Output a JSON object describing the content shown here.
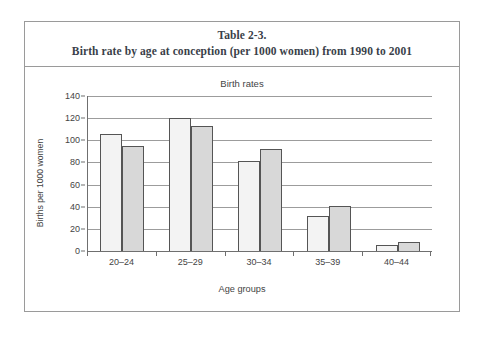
{
  "caption": {
    "line1": "Table 2-3.",
    "line2": "Birth rate by age at conception (per 1000 women) from 1990 to 2001"
  },
  "chart_data": {
    "type": "bar",
    "title": "Birth rates",
    "xlabel": "Age groups",
    "ylabel": "Births per 1000 women",
    "categories": [
      "20–24",
      "25–29",
      "30–34",
      "35–39",
      "40–44"
    ],
    "series": [
      {
        "name": "1990",
        "values": [
          106,
          120,
          81,
          32,
          5
        ],
        "color": "#f3f3f3"
      },
      {
        "name": "2001",
        "values": [
          95,
          113,
          92,
          41,
          8
        ],
        "color": "#d8d8d8"
      }
    ],
    "ylim": [
      0,
      140
    ],
    "yticks": [
      0,
      20,
      40,
      60,
      80,
      100,
      120,
      140
    ],
    "ytick_labels": [
      "0",
      "20",
      "40",
      "60",
      "80",
      "100",
      "120",
      "140"
    ],
    "grid": true,
    "legend": "none"
  }
}
